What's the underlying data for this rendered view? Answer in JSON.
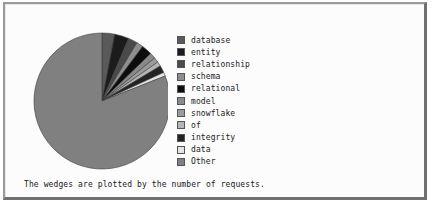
{
  "frame": {
    "background": "#fcfcfc",
    "border_light": "#9a9a9a",
    "border_dark": "#707070"
  },
  "caption": {
    "text": "The wedges are plotted by the number of requests."
  },
  "legend": {
    "position": "right",
    "items": [
      {
        "label": "database",
        "color": "#5a5a5a"
      },
      {
        "label": "entity",
        "color": "#1c1c1c"
      },
      {
        "label": "relationship",
        "color": "#4a4a4a"
      },
      {
        "label": "schema",
        "color": "#8e8e8e"
      },
      {
        "label": "relational",
        "color": "#0d0d0d"
      },
      {
        "label": "model",
        "color": "#8a8a8a"
      },
      {
        "label": "snowflake",
        "color": "#9b9b9b"
      },
      {
        "label": "of",
        "color": "#b4b4b4"
      },
      {
        "label": "integrity",
        "color": "#232323"
      },
      {
        "label": "data",
        "color": "#e4e4e4"
      },
      {
        "label": "Other",
        "color": "#808080"
      }
    ]
  },
  "chart_data": {
    "type": "pie",
    "title": "",
    "subtitle": "",
    "annotations": [
      "The wedges are plotted by the number of requests."
    ],
    "start_angle_deg": 90,
    "direction": "clockwise",
    "units": "number of requests",
    "labels": [
      "database",
      "entity",
      "relationship",
      "schema",
      "relational",
      "model",
      "snowflake",
      "of",
      "integrity",
      "data",
      "Other"
    ],
    "values": [
      3.0,
      3.4,
      2.2,
      1.6,
      2.5,
      1.4,
      1.2,
      1.1,
      1.7,
      0.9,
      81.0
    ],
    "percentages": [
      3.0,
      3.4,
      2.2,
      1.6,
      2.5,
      1.4,
      1.2,
      1.1,
      1.7,
      0.9,
      81.0
    ],
    "colors": [
      "#5a5a5a",
      "#1c1c1c",
      "#4a4a4a",
      "#8e8e8e",
      "#0d0d0d",
      "#8a8a8a",
      "#9b9b9b",
      "#b4b4b4",
      "#232323",
      "#e4e4e4",
      "#808080"
    ],
    "edge_color": "#3a3a3a",
    "legend": true,
    "legend_position": "right",
    "grid": false
  }
}
